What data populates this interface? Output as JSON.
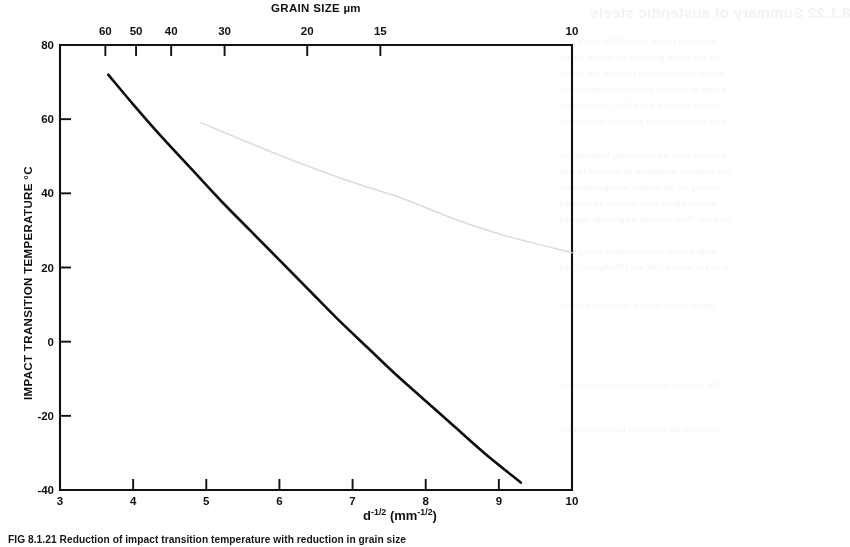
{
  "figure": {
    "caption": "FIG 8.1.21 Reduction of impact transition temperature with reduction in grain size"
  },
  "chart_data": {
    "type": "line",
    "title": "",
    "xlabel": "d⁻¹ᐟ² (mm⁻¹ᐟ²)",
    "xlabel_base": "d",
    "xlabel_exp": "-1/2",
    "xlabel_unit_base": "(mm",
    "xlabel_unit_exp": "-1/2",
    "xlabel_unit_close": ")",
    "ylabel": "IMPACT TRANSITION TEMPERATURE °C",
    "top_axis_label": "GRAIN SIZE µm",
    "xlim": [
      3,
      10
    ],
    "ylim": [
      -40,
      80
    ],
    "grid": false,
    "legend": "none",
    "x_ticks": [
      "3",
      "4",
      "5",
      "6",
      "7",
      "8",
      "9",
      "10"
    ],
    "x_tick_values": [
      3,
      4,
      5,
      6,
      7,
      8,
      9,
      10
    ],
    "y_ticks": [
      "80",
      "60",
      "40",
      "20",
      "0",
      "-20",
      "-40"
    ],
    "y_tick_values": [
      80,
      60,
      40,
      20,
      0,
      -20,
      -40
    ],
    "top_ticks": [
      "60",
      "50",
      "40",
      "30",
      "20",
      "15",
      "10"
    ],
    "top_tick_values": [
      60,
      50,
      40,
      30,
      20,
      15,
      10
    ],
    "top_tick_x": [
      3.62,
      4.04,
      4.52,
      5.25,
      6.38,
      7.38,
      10.0
    ],
    "series": [
      {
        "name": "impact transition temperature",
        "color": "#0d0d0d",
        "x": [
          3.66,
          4.0,
          4.4,
          4.8,
          5.2,
          5.6,
          6.0,
          6.4,
          6.8,
          7.2,
          7.6,
          8.0,
          8.4,
          8.8,
          9.3
        ],
        "y": [
          72.0,
          64.0,
          55.0,
          46.5,
          38.0,
          30.0,
          22.0,
          14.0,
          6.0,
          -1.5,
          -9.0,
          -16.0,
          -23.0,
          -30.0,
          -38.0
        ]
      },
      {
        "name": "faint-offset-impression",
        "color": "#d8d8d8",
        "x": [
          4.93,
          5.6,
          6.3,
          7.0,
          7.7,
          8.4,
          9.1,
          10.0
        ],
        "y": [
          59.0,
          53.5,
          48.0,
          43.0,
          38.5,
          33.0,
          28.5,
          24.0
        ]
      }
    ]
  },
  "ghost_text": {
    "heading": "8.1.22   Summary of austenitic steels",
    "lines": [
      "the carbon content below 0.03% for the type",
      "the low carbon grades are not suitable for use",
      "welded structures which cannot be heat treated",
      "a range of stabilised grades containing titanium",
      "niobium additions is available, these elements",
      "form stable carbides in preference to chromium",
      "austenitic steels are not normally hardenable by",
      "heat treatment, strength can be increased by cold",
      "working and the nitrogen bearing grades offer",
      "improved proof stress values in the annealed",
      "condition. These materials are generally supplied",
      "in the solution treated condition having been",
      "heated to between 1000 and 1100 degrees C and",
      "rapidly cooled to retain carbides in solution.",
      "The corrosion resistance of austenitic steels is",
      "superior to the ferritic and martensitic grades."
    ]
  }
}
